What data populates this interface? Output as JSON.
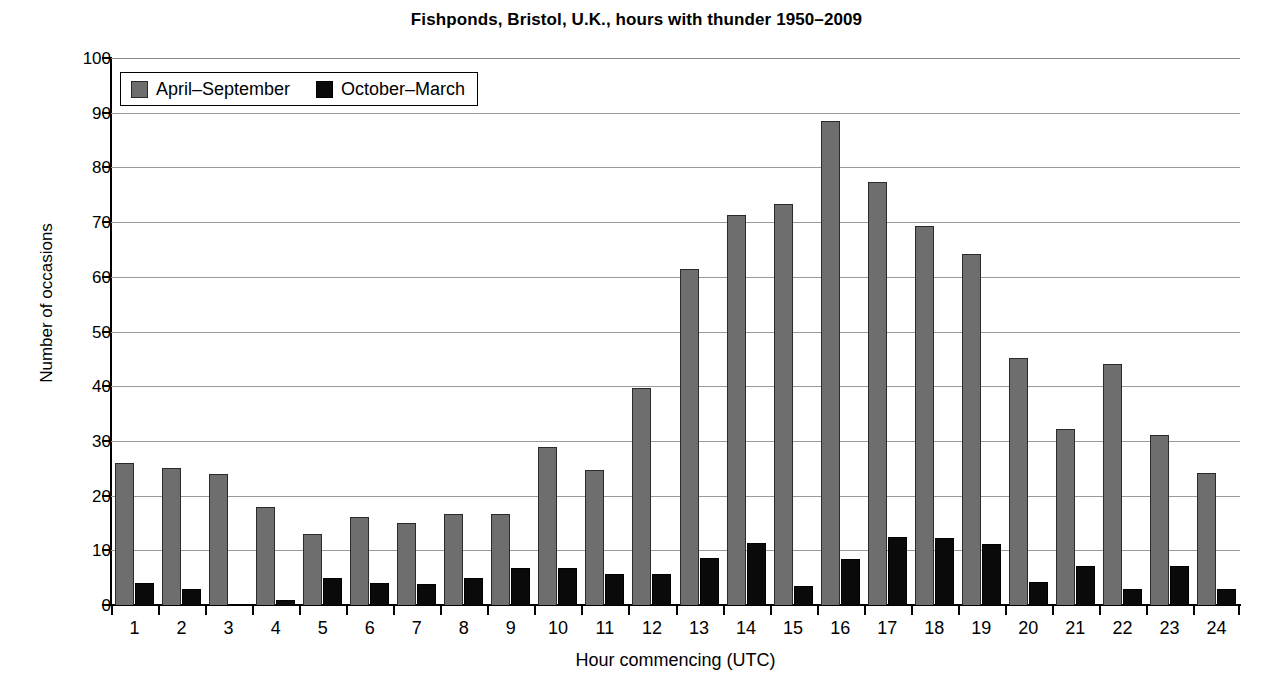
{
  "chart_data": {
    "type": "bar",
    "title": "Fishponds, Bristol, U.K., hours with thunder 1950–2009",
    "xlabel": "Hour commencing (UTC)",
    "ylabel": "Number of occasions",
    "categories": [
      "1",
      "2",
      "3",
      "4",
      "5",
      "6",
      "7",
      "8",
      "9",
      "10",
      "11",
      "12",
      "13",
      "14",
      "15",
      "16",
      "17",
      "18",
      "19",
      "20",
      "21",
      "22",
      "23",
      "24"
    ],
    "series": [
      {
        "name": "April–September",
        "color": "#6e6e6e",
        "values": [
          26,
          25,
          24,
          18,
          13,
          16,
          15,
          16.7,
          16.7,
          28.8,
          24.6,
          39.6,
          61.5,
          71.3,
          73.4,
          88.4,
          77.3,
          69.3,
          64.2,
          45.2,
          32.1,
          44.1,
          31.1,
          24.1
        ]
      },
      {
        "name": "October–March",
        "color": "#0a0a0a",
        "values": [
          4,
          3,
          0,
          1,
          5,
          4,
          3.8,
          4.9,
          6.7,
          6.7,
          5.7,
          5.6,
          8.6,
          11.4,
          3.4,
          8.5,
          12.4,
          12.3,
          11.2,
          4.2,
          7.2,
          3,
          7.1,
          3
        ]
      }
    ],
    "ylim": [
      0,
      100
    ],
    "yticks": [
      0,
      10,
      20,
      30,
      40,
      50,
      60,
      70,
      80,
      90,
      100
    ],
    "grid": "horizontal",
    "legend_position": "top-left"
  }
}
